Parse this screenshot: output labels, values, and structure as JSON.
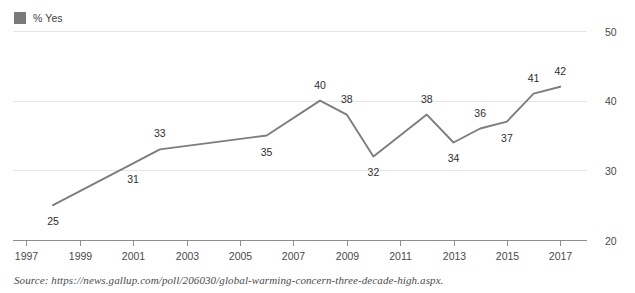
{
  "legend": {
    "label": "% Yes",
    "swatch_color": "#7a7a7a"
  },
  "source": {
    "text": "Source: https://news.gallup.com/poll/206030/global-warming-concern-three-decade-high.aspx."
  },
  "colors": {
    "line": "#7d7d7d",
    "grid": "#e6e6e6",
    "axis": "#8e8e8e",
    "label_text": "#2e2e2e"
  },
  "chart_data": {
    "type": "line",
    "title": "",
    "xlabel": "",
    "ylabel": "",
    "x": [
      1998,
      2001,
      2002,
      2006,
      2008,
      2009,
      2010,
      2012,
      2013,
      2014,
      2015,
      2016,
      2017
    ],
    "values": [
      25,
      31,
      33,
      35,
      40,
      38,
      32,
      38,
      34,
      36,
      37,
      41,
      42
    ],
    "point_labels": [
      "25",
      "31",
      "33",
      "35",
      "40",
      "38",
      "32",
      "38",
      "34",
      "36",
      "37",
      "41",
      "42"
    ],
    "label_positions": [
      "below",
      "below",
      "above",
      "below",
      "above",
      "above",
      "below",
      "above",
      "below",
      "above",
      "below",
      "above",
      "above"
    ],
    "series": [
      {
        "name": "% Yes",
        "values": [
          25,
          31,
          33,
          35,
          40,
          38,
          32,
          38,
          34,
          36,
          37,
          41,
          42
        ]
      }
    ],
    "xlim": [
      1996.5,
      2018
    ],
    "ylim": [
      20,
      50
    ],
    "xticks": [
      1997,
      1999,
      2001,
      2003,
      2005,
      2007,
      2009,
      2011,
      2013,
      2015,
      2017
    ],
    "xtick_labels": [
      "1997",
      "1999",
      "2001",
      "2003",
      "2005",
      "2007",
      "2009",
      "2011",
      "2013",
      "2015",
      "2017"
    ],
    "yticks": [
      20,
      30,
      40,
      50
    ],
    "ytick_labels": [
      "20",
      "30",
      "40",
      "50"
    ],
    "ytick_side": "right",
    "grid": true,
    "legend_position": "top-left"
  }
}
